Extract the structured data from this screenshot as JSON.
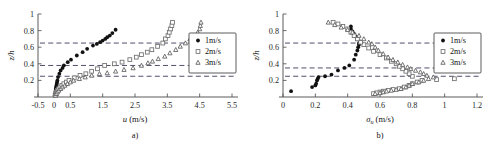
{
  "figure": {
    "background": "#ffffff",
    "panel_a_caption": "a)",
    "panel_b_caption": "b)"
  },
  "legend": {
    "position": "right-middle",
    "entries": [
      {
        "label": "1m/s",
        "marker": "filled-circle-marker",
        "color": "#111111"
      },
      {
        "label": "2m/s",
        "marker": "open-square-marker",
        "color": "#6e6e6e"
      },
      {
        "label": "3m/s",
        "marker": "open-triangle-marker",
        "color": "#5c5c5c"
      }
    ]
  },
  "chart_data": [
    {
      "id": "panel-a",
      "type": "scatter",
      "title": "",
      "caption": "a)",
      "xlabel": "u (m/s)",
      "xlabel_symbol": "u",
      "xlabel_unit": "(m/s)",
      "ylabel": "z/h",
      "xlim": [
        -0.5,
        5.5
      ],
      "ylim": [
        0,
        1
      ],
      "xticks": [
        -0.5,
        0,
        0.5,
        1.5,
        2.5,
        3.5,
        4.5,
        5.5
      ],
      "xticklabels": [
        "-0.5",
        "0",
        "0.5",
        "1.5",
        "2.5",
        "3.5",
        "4.5",
        "5.5"
      ],
      "yticks": [
        0.2,
        0.4,
        0.6,
        0.8,
        1
      ],
      "yticklabels": [
        "0.2",
        "0.4",
        "0.6",
        "0.8",
        "1"
      ],
      "grid": false,
      "reference_lines": {
        "orientation": "horizontal",
        "values": [
          0.65,
          0.38,
          0.25
        ],
        "style": "dashed"
      },
      "series": [
        {
          "name": "1m/s",
          "marker": "filled-circle-marker",
          "points": [
            [
              0.02,
              0.02
            ],
            [
              0.03,
              0.04
            ],
            [
              0.04,
              0.06
            ],
            [
              0.05,
              0.08
            ],
            [
              0.05,
              0.1
            ],
            [
              0.06,
              0.12
            ],
            [
              0.07,
              0.14
            ],
            [
              0.08,
              0.16
            ],
            [
              0.09,
              0.18
            ],
            [
              0.1,
              0.2
            ],
            [
              0.12,
              0.24
            ],
            [
              0.16,
              0.28
            ],
            [
              0.2,
              0.32
            ],
            [
              0.26,
              0.35
            ],
            [
              0.3,
              0.38
            ],
            [
              0.42,
              0.42
            ],
            [
              0.52,
              0.45
            ],
            [
              0.7,
              0.5
            ],
            [
              0.88,
              0.54
            ],
            [
              1.02,
              0.58
            ],
            [
              1.2,
              0.62
            ],
            [
              1.32,
              0.64
            ],
            [
              1.42,
              0.66
            ],
            [
              1.5,
              0.68
            ],
            [
              1.58,
              0.7
            ],
            [
              1.64,
              0.72
            ],
            [
              1.72,
              0.74
            ],
            [
              1.8,
              0.77
            ],
            [
              1.9,
              0.81
            ]
          ]
        },
        {
          "name": "2m/s",
          "marker": "open-square-marker",
          "points": [
            [
              0.03,
              0.02
            ],
            [
              0.05,
              0.04
            ],
            [
              0.07,
              0.06
            ],
            [
              0.1,
              0.08
            ],
            [
              0.14,
              0.1
            ],
            [
              0.18,
              0.12
            ],
            [
              0.24,
              0.14
            ],
            [
              0.3,
              0.16
            ],
            [
              0.38,
              0.18
            ],
            [
              0.46,
              0.2
            ],
            [
              0.62,
              0.23
            ],
            [
              0.8,
              0.26
            ],
            [
              0.98,
              0.28
            ],
            [
              1.16,
              0.31
            ],
            [
              1.34,
              0.34
            ],
            [
              1.56,
              0.38
            ],
            [
              1.86,
              0.4
            ],
            [
              2.1,
              0.42
            ],
            [
              2.34,
              0.45
            ],
            [
              2.54,
              0.48
            ],
            [
              2.7,
              0.51
            ],
            [
              2.88,
              0.54
            ],
            [
              3.02,
              0.57
            ],
            [
              3.2,
              0.61
            ],
            [
              3.36,
              0.65
            ],
            [
              3.44,
              0.7
            ],
            [
              3.52,
              0.74
            ],
            [
              3.56,
              0.78
            ],
            [
              3.6,
              0.82
            ],
            [
              3.64,
              0.86
            ],
            [
              3.66,
              0.9
            ]
          ]
        },
        {
          "name": "3m/s",
          "marker": "open-triangle-marker",
          "points": [
            [
              0.04,
              0.02
            ],
            [
              0.07,
              0.04
            ],
            [
              0.1,
              0.06
            ],
            [
              0.14,
              0.08
            ],
            [
              0.2,
              0.1
            ],
            [
              0.26,
              0.12
            ],
            [
              0.33,
              0.14
            ],
            [
              0.41,
              0.16
            ],
            [
              0.5,
              0.18
            ],
            [
              0.6,
              0.2
            ],
            [
              0.78,
              0.22
            ],
            [
              0.96,
              0.24
            ],
            [
              1.16,
              0.26
            ],
            [
              1.4,
              0.28
            ],
            [
              1.64,
              0.29
            ],
            [
              1.9,
              0.31
            ],
            [
              2.16,
              0.33
            ],
            [
              2.44,
              0.35
            ],
            [
              2.7,
              0.38
            ],
            [
              2.9,
              0.41
            ],
            [
              3.04,
              0.43
            ],
            [
              3.22,
              0.46
            ],
            [
              3.42,
              0.49
            ],
            [
              3.58,
              0.53
            ],
            [
              3.76,
              0.57
            ],
            [
              3.9,
              0.61
            ],
            [
              4.06,
              0.65
            ],
            [
              4.2,
              0.7
            ],
            [
              4.34,
              0.74
            ],
            [
              4.44,
              0.78
            ],
            [
              4.5,
              0.82
            ],
            [
              4.52,
              0.86
            ],
            [
              4.54,
              0.9
            ]
          ]
        }
      ]
    },
    {
      "id": "panel-b",
      "type": "scatter",
      "title": "",
      "caption": "b)",
      "xlabel": "σu (m/s)",
      "xlabel_symbol": "σ",
      "xlabel_subscript": "u",
      "xlabel_unit": "(m/s)",
      "ylabel": "z/h",
      "xlim": [
        0,
        1.2
      ],
      "ylim": [
        0,
        1
      ],
      "xticks": [
        0,
        0.2,
        0.4,
        0.6,
        0.8,
        1.0,
        1.2
      ],
      "xticklabels": [
        "0",
        "0.2",
        "0.4",
        "0.6",
        "0.8",
        "1",
        "1.2"
      ],
      "yticks": [
        0.2,
        0.4,
        0.6,
        0.8,
        1
      ],
      "yticklabels": [
        "0.2",
        "0.4",
        "0.6",
        "0.8",
        "1"
      ],
      "grid": false,
      "reference_lines": {
        "orientation": "horizontal",
        "values": [
          0.65,
          0.35,
          0.25
        ],
        "style": "dashed"
      },
      "series": [
        {
          "name": "1m/s",
          "marker": "filled-circle-marker",
          "points": [
            [
              0.05,
              0.07
            ],
            [
              0.18,
              0.12
            ],
            [
              0.2,
              0.14
            ],
            [
              0.205,
              0.16
            ],
            [
              0.21,
              0.2
            ],
            [
              0.215,
              0.22
            ],
            [
              0.22,
              0.24
            ],
            [
              0.26,
              0.25
            ],
            [
              0.3,
              0.27
            ],
            [
              0.34,
              0.32
            ],
            [
              0.38,
              0.35
            ],
            [
              0.41,
              0.38
            ],
            [
              0.44,
              0.45
            ],
            [
              0.45,
              0.51
            ],
            [
              0.46,
              0.56
            ],
            [
              0.465,
              0.6
            ],
            [
              0.47,
              0.63
            ],
            [
              0.47,
              0.65
            ],
            [
              0.475,
              0.67
            ],
            [
              0.46,
              0.7
            ],
            [
              0.45,
              0.73
            ],
            [
              0.44,
              0.76
            ],
            [
              0.43,
              0.79
            ],
            [
              0.42,
              0.82
            ],
            [
              0.42,
              0.85
            ]
          ]
        },
        {
          "name": "2m/s",
          "marker": "open-square-marker",
          "points": [
            [
              0.56,
              0.04
            ],
            [
              0.58,
              0.05
            ],
            [
              0.6,
              0.06
            ],
            [
              0.62,
              0.07
            ],
            [
              0.65,
              0.08
            ],
            [
              0.68,
              0.09
            ],
            [
              0.72,
              0.1
            ],
            [
              0.75,
              0.12
            ],
            [
              0.78,
              0.14
            ],
            [
              0.8,
              0.16
            ],
            [
              0.83,
              0.18
            ],
            [
              0.86,
              0.2
            ],
            [
              0.95,
              0.21
            ],
            [
              1.06,
              0.22
            ],
            [
              0.8,
              0.25
            ],
            [
              0.78,
              0.28
            ],
            [
              0.76,
              0.31
            ],
            [
              0.74,
              0.34
            ],
            [
              0.72,
              0.37
            ],
            [
              0.7,
              0.4
            ],
            [
              0.67,
              0.43
            ],
            [
              0.64,
              0.47
            ],
            [
              0.6,
              0.51
            ],
            [
              0.56,
              0.55
            ],
            [
              0.53,
              0.59
            ],
            [
              0.5,
              0.63
            ],
            [
              0.48,
              0.66
            ],
            [
              0.46,
              0.7
            ],
            [
              0.44,
              0.74
            ],
            [
              0.42,
              0.78
            ],
            [
              0.4,
              0.82
            ],
            [
              0.37,
              0.85
            ],
            [
              0.34,
              0.88
            ],
            [
              0.31,
              0.9
            ]
          ]
        },
        {
          "name": "3m/s",
          "marker": "open-triangle-marker",
          "points": [
            [
              0.57,
              0.04
            ],
            [
              0.6,
              0.05
            ],
            [
              0.62,
              0.06
            ],
            [
              0.64,
              0.07
            ],
            [
              0.67,
              0.08
            ],
            [
              0.7,
              0.09
            ],
            [
              0.73,
              0.1
            ],
            [
              0.76,
              0.12
            ],
            [
              0.78,
              0.14
            ],
            [
              0.8,
              0.16
            ],
            [
              0.84,
              0.18
            ],
            [
              0.87,
              0.2
            ],
            [
              0.9,
              0.22
            ],
            [
              0.93,
              0.24
            ],
            [
              0.89,
              0.26
            ],
            [
              0.87,
              0.28
            ],
            [
              0.85,
              0.3
            ],
            [
              0.82,
              0.32
            ],
            [
              0.79,
              0.34
            ],
            [
              0.77,
              0.36
            ],
            [
              0.74,
              0.39
            ],
            [
              0.71,
              0.42
            ],
            [
              0.68,
              0.45
            ],
            [
              0.65,
              0.48
            ],
            [
              0.62,
              0.52
            ],
            [
              0.59,
              0.56
            ],
            [
              0.57,
              0.6
            ],
            [
              0.55,
              0.64
            ],
            [
              0.53,
              0.66
            ],
            [
              0.5,
              0.7
            ],
            [
              0.47,
              0.74
            ],
            [
              0.43,
              0.78
            ],
            [
              0.4,
              0.81
            ],
            [
              0.36,
              0.84
            ],
            [
              0.32,
              0.87
            ],
            [
              0.28,
              0.9
            ]
          ]
        }
      ]
    }
  ]
}
